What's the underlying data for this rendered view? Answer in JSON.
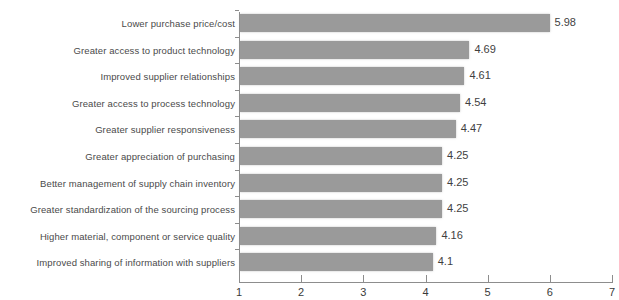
{
  "chart_data": {
    "type": "bar",
    "orientation": "horizontal",
    "title": "",
    "xlabel": "",
    "ylabel": "",
    "xlim": [
      1,
      7
    ],
    "xticks": [
      "1",
      "2",
      "3",
      "4",
      "5",
      "6",
      "7"
    ],
    "grid": false,
    "legend": null,
    "bar_color": "#9a9a9a",
    "categories": [
      "Lower purchase price/cost",
      "Greater access to product technology",
      "Improved supplier relationships",
      "Greater access to process technology",
      "Greater supplier responsiveness",
      "Greater appreciation of purchasing",
      "Better management of supply chain inventory",
      "Greater standardization of the sourcing process",
      "Higher material, component or service quality",
      "Improved sharing of information with suppliers"
    ],
    "values": [
      5.98,
      4.69,
      4.61,
      4.54,
      4.47,
      4.25,
      4.25,
      4.25,
      4.16,
      4.1
    ],
    "value_labels": [
      "5.98",
      "4.69",
      "4.61",
      "4.54",
      "4.47",
      "4.25",
      "4.25",
      "4.25",
      "4.16",
      "4.1"
    ]
  },
  "cut_off_title": ""
}
